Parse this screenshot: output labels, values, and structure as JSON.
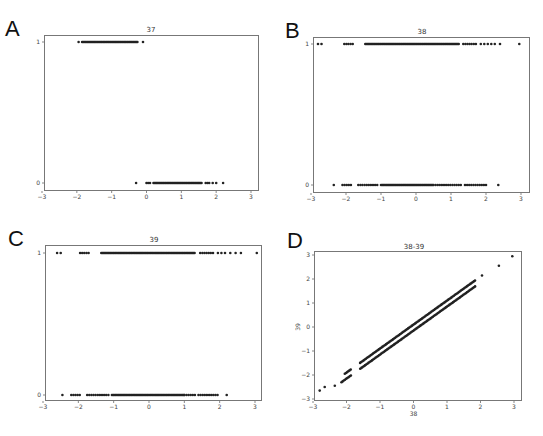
{
  "figure": {
    "panels": [
      {
        "letter": "A",
        "title": "37"
      },
      {
        "letter": "B",
        "title": "38"
      },
      {
        "letter": "C",
        "title": "39"
      },
      {
        "letter": "D",
        "title": "38-39",
        "xlabel": "38",
        "ylabel": "39"
      }
    ]
  },
  "chart_data": [
    {
      "type": "scatter",
      "panel": "A",
      "title": "37",
      "xlabel": "",
      "ylabel": "",
      "xlim": [
        -3,
        3
      ],
      "ylim": [
        0,
        1
      ],
      "xticks": [
        "-3",
        "-2",
        "-1",
        "0",
        "1",
        "2",
        "3"
      ],
      "yticks": [
        "0",
        "1"
      ],
      "grid": false,
      "series": [
        {
          "name": "y=1",
          "y": 1,
          "x_dense_range": [
            -1.85,
            -0.25
          ],
          "x_sparse": [
            -1.95,
            -0.1
          ]
        },
        {
          "name": "y=0",
          "y": 0,
          "x_dense_range": [
            0.2,
            1.6
          ],
          "x_sparse": [
            -0.3,
            0.0,
            0.05,
            0.1,
            1.7,
            1.75,
            1.8,
            1.9,
            2.0,
            2.2
          ]
        }
      ]
    },
    {
      "type": "scatter",
      "panel": "B",
      "title": "38",
      "xlabel": "",
      "ylabel": "",
      "xlim": [
        -3,
        3
      ],
      "ylim": [
        0,
        1
      ],
      "xticks": [
        "-3",
        "-2",
        "-1",
        "0",
        "1",
        "2",
        "3"
      ],
      "yticks": [
        "0",
        "1"
      ],
      "grid": false,
      "series": [
        {
          "name": "y=1",
          "y": 1,
          "x_dense_range": [
            -1.45,
            1.25
          ],
          "x_clusters": [
            [
              -2.05,
              -1.8
            ],
            [
              1.35,
              1.75
            ]
          ],
          "x_sparse": [
            -2.8,
            -2.7,
            1.85,
            1.95,
            2.05,
            2.15,
            2.25,
            2.4,
            2.95
          ]
        },
        {
          "name": "y=0",
          "y": 0,
          "x_dense_range": [
            -1.0,
            0.5
          ],
          "x_clusters": [
            [
              -2.1,
              -1.85
            ],
            [
              -1.65,
              -1.05
            ],
            [
              0.5,
              1.3
            ],
            [
              1.4,
              2.05
            ]
          ],
          "x_sparse": [
            -2.35,
            2.35
          ]
        }
      ]
    },
    {
      "type": "scatter",
      "panel": "C",
      "title": "39",
      "xlabel": "",
      "ylabel": "",
      "xlim": [
        -3,
        3
      ],
      "ylim": [
        0,
        1
      ],
      "xticks": [
        "-3",
        "-2",
        "-1",
        "0",
        "1",
        "2",
        "3"
      ],
      "yticks": [
        "0",
        "1"
      ],
      "grid": false,
      "series": [
        {
          "name": "y=1",
          "y": 1,
          "x_dense_range": [
            -1.35,
            1.3
          ],
          "x_clusters": [
            [
              -1.95,
              -1.7
            ],
            [
              1.45,
              1.85
            ]
          ],
          "x_sparse": [
            -2.6,
            -2.5,
            1.95,
            2.05,
            2.15,
            2.3,
            2.45,
            2.6,
            3.05
          ]
        },
        {
          "name": "y=0",
          "y": 0,
          "x_dense_range": [
            -1.05,
            1.0
          ],
          "x_clusters": [
            [
              -2.2,
              -1.95
            ],
            [
              -1.75,
              -1.1
            ],
            [
              1.0,
              1.35
            ],
            [
              1.4,
              1.95
            ]
          ],
          "x_sparse": [
            -2.45,
            2.2
          ]
        }
      ]
    },
    {
      "type": "scatter",
      "panel": "D",
      "title": "38-39",
      "xlabel": "38",
      "ylabel": "39",
      "xlim": [
        -3,
        3
      ],
      "ylim": [
        -3,
        3
      ],
      "xticks": [
        "-3",
        "-2",
        "-1",
        "0",
        "1",
        "2",
        "3"
      ],
      "yticks": [
        "-3",
        "-2",
        "-1",
        "0",
        "1",
        "2",
        "3"
      ],
      "grid": false,
      "series": [
        {
          "name": "upper band",
          "relation": "y = x + 0.1",
          "x_range": [
            -2.05,
            2.45
          ]
        },
        {
          "name": "lower band",
          "relation": "y = x - 0.15",
          "x_range": [
            -2.15,
            2.35
          ]
        },
        {
          "name": "outliers",
          "points": [
            [
              -2.8,
              -2.65
            ],
            [
              -2.65,
              -2.5
            ],
            [
              -2.35,
              -2.45
            ],
            [
              2.55,
              2.55
            ],
            [
              2.95,
              2.95
            ]
          ]
        }
      ]
    }
  ]
}
